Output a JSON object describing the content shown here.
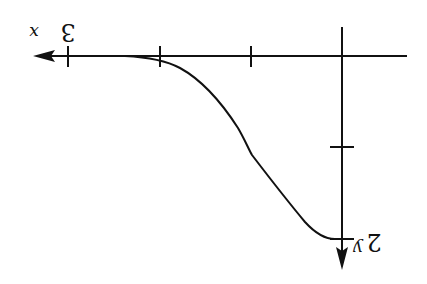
{
  "figure": {
    "orientation": "rotated-180",
    "stroke_color": "#111111",
    "background": "#ffffff"
  },
  "axes": {
    "horizontal": {
      "label": "x",
      "arrow_direction": "left",
      "tick_value_label": "3",
      "ticks_count": 3
    },
    "vertical": {
      "label": "y",
      "arrow_direction": "down",
      "tick_value_label": "2",
      "ticks_count": 2
    }
  },
  "curve": {
    "description": "smooth decreasing S-shaped curve from the y-axis tick at 2 toward the x-axis, flattening asymptotically near x = 3",
    "start": {
      "x": 0,
      "y": 2
    },
    "end": {
      "x": 3,
      "y": 0
    }
  }
}
